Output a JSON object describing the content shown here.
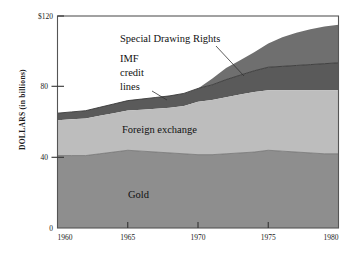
{
  "chart_data": {
    "type": "area",
    "stacked": true,
    "title": "",
    "xlabel": "",
    "ylabel": "DOLLARS (in billions)",
    "y_axis_prefix": "$",
    "xlim": [
      1960,
      1980
    ],
    "ylim": [
      0,
      120
    ],
    "x_ticks": [
      "1960",
      "1965",
      "1970",
      "1975",
      "1980"
    ],
    "x_tick_values": [
      1960,
      1965,
      1970,
      1975,
      1980
    ],
    "y_ticks": [
      "0",
      "40",
      "80",
      "$120"
    ],
    "y_tick_values": [
      0,
      40,
      80,
      120
    ],
    "grid": false,
    "legend": "inline-annotations",
    "x": [
      1960,
      1961,
      1962,
      1963,
      1964,
      1965,
      1966,
      1967,
      1968,
      1969,
      1970,
      1971,
      1972,
      1973,
      1974,
      1975,
      1976,
      1977,
      1978,
      1979,
      1980
    ],
    "series": [
      {
        "name": "Gold",
        "color": "#8e8e8e",
        "values": [
          41,
          41,
          41,
          42,
          43,
          44,
          43.5,
          43,
          42.5,
          42,
          41.5,
          41.5,
          42,
          42.5,
          43,
          44,
          43.5,
          43,
          42.5,
          42,
          42
        ]
      },
      {
        "name": "Foreign exchange",
        "color": "#bdbdbd",
        "values": [
          20,
          20.5,
          21,
          21.5,
          22,
          22.5,
          23.5,
          24.5,
          25.5,
          27,
          30,
          31,
          32,
          33,
          34,
          34,
          34.5,
          35,
          35.5,
          36,
          36
        ]
      },
      {
        "name": "IMF credit lines",
        "color": "#5a5a5a",
        "values": [
          4,
          4.2,
          4.4,
          4.8,
          5.2,
          5.6,
          6.0,
          6.4,
          6.8,
          7.2,
          7.5,
          8.5,
          10.0,
          11.0,
          12.0,
          13.0,
          13.5,
          14.0,
          14.5,
          15.0,
          15.5
        ]
      },
      {
        "name": "Special Drawing Rights",
        "color": "#6f6f6f",
        "values": [
          0,
          0,
          0,
          0,
          0,
          0,
          0,
          0,
          0,
          0,
          0,
          3.5,
          6.5,
          8.5,
          10.5,
          13.5,
          16.5,
          18.5,
          20.0,
          21.0,
          21.5
        ]
      }
    ],
    "totals": [
      65,
      65.7,
      66.4,
      68.3,
      70.2,
      72.1,
      73.0,
      73.9,
      74.8,
      76.2,
      79.0,
      84.5,
      90.5,
      95.0,
      99.5,
      104.5,
      108.0,
      110.5,
      112.5,
      114.0,
      115.0
    ],
    "annotations": [
      {
        "id": "sdr",
        "text": "Special Drawing Rights",
        "lines": [
          "Special Drawing Rights"
        ],
        "points_to": "Special Drawing Rights"
      },
      {
        "id": "imf",
        "text": "IMF credit lines",
        "lines": [
          "IMF",
          "credit",
          "lines"
        ],
        "points_to": "IMF credit lines"
      },
      {
        "id": "fx",
        "text": "Foreign exchange",
        "lines": [
          "Foreign exchange"
        ],
        "points_to": "Foreign exchange"
      },
      {
        "id": "gold",
        "text": "Gold",
        "lines": [
          "Gold"
        ],
        "points_to": "Gold"
      }
    ]
  },
  "axis": {
    "y_title": "DOLLARS (in billions)",
    "y_tick_0": "0",
    "y_tick_40": "40",
    "y_tick_80": "80",
    "y_tick_120": "$120",
    "x_tick_1960": "1960",
    "x_tick_1965": "1965",
    "x_tick_1970": "1970",
    "x_tick_1975": "1975",
    "x_tick_1980": "1980"
  },
  "labels": {
    "sdr": "Special Drawing Rights",
    "imf_1": "IMF",
    "imf_2": "credit",
    "imf_3": "lines",
    "fx": "Foreign exchange",
    "gold": "Gold"
  },
  "colors": {
    "gold": "#8e8e8e",
    "foreign_exchange": "#bdbdbd",
    "imf": "#5a5a5a",
    "sdr": "#6f6f6f",
    "background": "#ffffff",
    "frame": "#555555",
    "text": "#111111"
  }
}
